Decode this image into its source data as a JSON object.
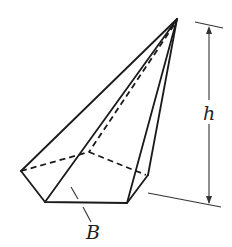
{
  "figure": {
    "labels": {
      "height": "h",
      "base": "B"
    },
    "colors": {
      "line": "#1a1a1a",
      "background": "#ffffff"
    }
  }
}
